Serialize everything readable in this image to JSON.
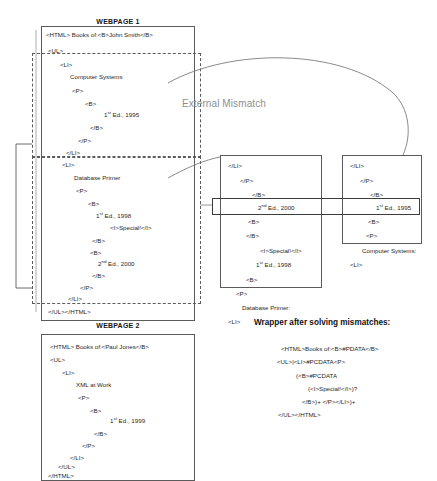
{
  "webpage1": {
    "caption": "WEBPAGE 1",
    "lines": [
      {
        "text": "<HTML> Books of:<B>John Smith</B>",
        "x": 46,
        "y": 32
      },
      {
        "text": "<UL>",
        "x": 48,
        "y": 48
      },
      {
        "text": "<LI>",
        "x": 60,
        "y": 62
      },
      {
        "text": "Computer Systems",
        "x": 70,
        "y": 74
      },
      {
        "text": "<P>",
        "x": 72,
        "y": 88
      },
      {
        "text": "<B>",
        "x": 85,
        "y": 101
      },
      {
        "text": "1st Ed., 1995",
        "x": 104,
        "y": 112,
        "sup": "st",
        "sup_after": "1"
      },
      {
        "text": "</B>",
        "x": 90,
        "y": 125
      },
      {
        "text": "</P>",
        "x": 78,
        "y": 138
      },
      {
        "text": "</LI>",
        "x": 66,
        "y": 150
      },
      {
        "text": "<LI>",
        "x": 62,
        "y": 162
      },
      {
        "text": "Database Primer",
        "x": 74,
        "y": 175
      },
      {
        "text": "<P>",
        "x": 76,
        "y": 188
      },
      {
        "text": "<B>",
        "x": 88,
        "y": 201
      },
      {
        "text": "1st Ed., 1998",
        "x": 96,
        "y": 213,
        "sup": "st",
        "sup_after": "1"
      },
      {
        "text": "<I>Special!</I>",
        "x": 110,
        "y": 225
      },
      {
        "text": "</B>",
        "x": 92,
        "y": 238
      },
      {
        "text": "<B>",
        "x": 90,
        "y": 250
      },
      {
        "text": "2nd Ed., 2000",
        "x": 98,
        "y": 261,
        "sup": "nd",
        "sup_after": "2"
      },
      {
        "text": "</B>",
        "x": 92,
        "y": 273
      },
      {
        "text": "</P>",
        "x": 80,
        "y": 285
      },
      {
        "text": "</LI>",
        "x": 68,
        "y": 296
      },
      {
        "text": "</UL></HTML>",
        "x": 48,
        "y": 309
      }
    ]
  },
  "webpage2": {
    "caption": "WEBPAGE 2",
    "lines": [
      {
        "text": "<HTML> Books of:<Paul Jones</B>",
        "x": 50,
        "y": 344
      },
      {
        "text": "<UL>",
        "x": 50,
        "y": 357
      },
      {
        "text": "<LI>",
        "x": 62,
        "y": 370
      },
      {
        "text": "XML at Work",
        "x": 76,
        "y": 382
      },
      {
        "text": "<P>",
        "x": 78,
        "y": 395
      },
      {
        "text": "<B>",
        "x": 90,
        "y": 408
      },
      {
        "text": "1st Ed., 1999",
        "x": 110,
        "y": 418,
        "sup": "st",
        "sup_after": "1"
      },
      {
        "text": "</B>",
        "x": 94,
        "y": 431
      },
      {
        "text": "</P>",
        "x": 82,
        "y": 443
      },
      {
        "text": "</LI>",
        "x": 70,
        "y": 455
      },
      {
        "text": "</UL>",
        "x": 58,
        "y": 464
      },
      {
        "text": "</HTML>",
        "x": 48,
        "y": 473
      }
    ]
  },
  "middle_box": {
    "lines": [
      {
        "text": "</LI>",
        "x": 228,
        "y": 163
      },
      {
        "text": "</P>",
        "x": 240,
        "y": 178
      },
      {
        "text": "</B>",
        "x": 252,
        "y": 192
      },
      {
        "text": "2nd Ed., 2000",
        "x": 258,
        "y": 205,
        "sup": "nd",
        "sup_after": "2"
      },
      {
        "text": "<B>",
        "x": 248,
        "y": 219
      },
      {
        "text": "</B>",
        "x": 246,
        "y": 233
      },
      {
        "text": "<I>Special!</I>",
        "x": 260,
        "y": 248
      },
      {
        "text": "1st Ed., 1998",
        "x": 256,
        "y": 262,
        "sup": "st",
        "sup_after": "1"
      },
      {
        "text": "<B>",
        "x": 246,
        "y": 277
      },
      {
        "text": "<P>",
        "x": 236,
        "y": 291
      },
      {
        "text": "Database Primer:",
        "x": 242,
        "y": 305
      },
      {
        "text": "<LI>",
        "x": 228,
        "y": 319
      }
    ]
  },
  "right_box": {
    "lines": [
      {
        "text": "</LI>",
        "x": 350,
        "y": 163
      },
      {
        "text": "</P>",
        "x": 360,
        "y": 178
      },
      {
        "text": "</B>",
        "x": 370,
        "y": 192
      },
      {
        "text": "1st Ed., 1995",
        "x": 376,
        "y": 205,
        "sup": "st",
        "sup_after": "1"
      },
      {
        "text": "<B>",
        "x": 368,
        "y": 219
      },
      {
        "text": "<P>",
        "x": 366,
        "y": 233
      },
      {
        "text": "Computer Systems:",
        "x": 362,
        "y": 248
      },
      {
        "text": "<LI>",
        "x": 350,
        "y": 262
      }
    ]
  },
  "annotations": {
    "external_mismatch": "External Mismatch"
  },
  "wrapper": {
    "title": "Wrapper after solving mismatches:",
    "lines": [
      {
        "text": "<HTML>Books of:<B>#PDATA</B>",
        "x": 281,
        "y": 345
      },
      {
        "text": "<UL>|<LI>#PCDATA<P>",
        "x": 277,
        "y": 358
      },
      {
        "text": "(<B>#PCDATA",
        "x": 296,
        "y": 372
      },
      {
        "text": "(<I>Special!</I>)?",
        "x": 308,
        "y": 385
      },
      {
        "text": "</B>)+ </P></LI>)+",
        "x": 302,
        "y": 398
      },
      {
        "text": "</UL></HTML>",
        "x": 278,
        "y": 411
      }
    ]
  },
  "colors": {
    "stroke": "#5b5b5b",
    "text": "#1f1f1f",
    "muted": "#8f8f8f",
    "background": "#ffffff"
  }
}
